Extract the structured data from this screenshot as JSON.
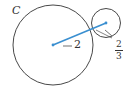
{
  "diagram": {
    "circle_label": "C",
    "big_radius_label": "2",
    "small_radius_label_num": "2",
    "small_radius_label_den": "3",
    "colors": {
      "stroke": "#333333",
      "line": "#3a8fd0",
      "bg": "#ffffff"
    }
  }
}
